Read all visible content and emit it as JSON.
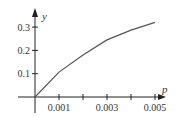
{
  "chart_data": {
    "type": "line",
    "title": "",
    "xlabel": "p",
    "ylabel": "y",
    "x": [
      0,
      0.001,
      0.002,
      0.003,
      0.004,
      0.005
    ],
    "series": [
      {
        "name": "y",
        "values": [
          0,
          0.107,
          0.18,
          0.245,
          0.287,
          0.32
        ]
      }
    ],
    "xlim": [
      0,
      0.0055
    ],
    "ylim": [
      0,
      0.35
    ],
    "x_ticks": [
      0.001,
      0.002,
      0.003,
      0.004,
      0.005
    ],
    "x_tick_labels": [
      "0.001",
      "",
      "0.003",
      "",
      "0.005"
    ],
    "y_ticks": [
      0.1,
      0.2,
      0.3
    ],
    "y_tick_labels": [
      "0.1",
      "0.2",
      "0.3"
    ],
    "grid": false,
    "legend": null,
    "colors": {
      "axis": "#222222",
      "line": "#555555"
    }
  }
}
